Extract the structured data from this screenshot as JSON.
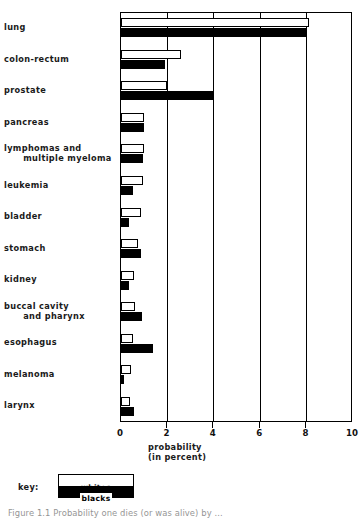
{
  "chart_data": {
    "type": "bar",
    "orientation": "horizontal",
    "title": "",
    "xlabel": "probability\n(in percent)",
    "xlabel_line1": "probability",
    "xlabel_line2": "(in percent)",
    "ylabel": "",
    "xlim": [
      0,
      10
    ],
    "xticks": [
      0,
      2,
      4,
      6,
      8,
      10
    ],
    "xtick_labels": [
      "0",
      "2",
      "4",
      "6",
      "8",
      "10"
    ],
    "grid": true,
    "grid_axis": "x",
    "legend_position": "below-left",
    "categories": [
      "lung",
      "colon-rectum",
      "prostate",
      "pancreas",
      "lymphomas and\n   multiple myeloma",
      "leukemia",
      "bladder",
      "stomach",
      "kidney",
      "buccal cavity\n   and pharynx",
      "esophagus",
      "melanoma",
      "larynx"
    ],
    "series": [
      {
        "name": "whites",
        "color": "#ffffff",
        "edge_color": "#000000",
        "values": [
          8.1,
          2.6,
          2.0,
          1.0,
          1.0,
          0.95,
          0.85,
          0.75,
          0.55,
          0.6,
          0.5,
          0.45,
          0.4
        ]
      },
      {
        "name": "blacks",
        "color": "#000000",
        "edge_color": "#000000",
        "values": [
          8.0,
          1.9,
          4.0,
          1.0,
          0.95,
          0.5,
          0.35,
          0.85,
          0.35,
          0.9,
          1.4,
          0.15,
          0.55
        ]
      }
    ]
  },
  "axis": {
    "tick_labels": [
      "0",
      "2",
      "4",
      "6",
      "8",
      "10"
    ],
    "title_line1": "probability",
    "title_line2": "(in percent)"
  },
  "legend": {
    "caption": "key:",
    "whites_label": "whites",
    "blacks_label": "blacks"
  },
  "caption": "Figure 1.1 Probability one dies (or was alive) by ...",
  "colors": {
    "whites_fill": "#ffffff",
    "blacks_fill": "#000000",
    "axis": "#000000",
    "text": "#1a1a1a"
  }
}
